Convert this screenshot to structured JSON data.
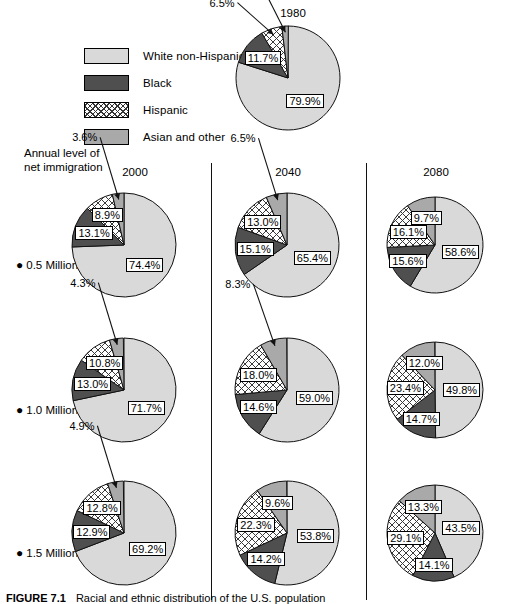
{
  "legend": {
    "items": [
      {
        "label": "White non-Hispanic",
        "key": "white",
        "swatch": "light-gray-solid",
        "color": "#d9d9d9"
      },
      {
        "label": "Black",
        "key": "black",
        "swatch": "dark-gray-solid",
        "color": "#4f4f4f"
      },
      {
        "label": "Hispanic",
        "key": "hispanic",
        "swatch": "crosshatch",
        "color": "#ffffff"
      },
      {
        "label": "Asian and other",
        "key": "asian",
        "swatch": "medium-gray-solid",
        "color": "#a9a9a9"
      }
    ]
  },
  "annual_caption": "Annual level of\nnet immigration",
  "row_labels": [
    {
      "bullet": "●",
      "text": "0.5 Million"
    },
    {
      "bullet": "●",
      "text": "1.0 Million"
    },
    {
      "bullet": "●",
      "text": "1.5 Million"
    }
  ],
  "bottom_caption": {
    "figure": "FIGURE 7.1",
    "text": "Racial and ethnic distribution of the U.S. population"
  },
  "chart_data": {
    "type": "pie",
    "categories": [
      "White non-Hispanic",
      "Black",
      "Hispanic",
      "Asian and other"
    ],
    "colors": [
      "#d9d9d9",
      "#4f4f4f",
      "#ffffff",
      "#a9a9a9"
    ],
    "units": "percent",
    "charts": [
      {
        "id": "pie-1980",
        "year": "1980",
        "immigration": null,
        "labels": [
          "79.9%",
          "11.7%",
          "6.5%",
          "2.0%"
        ],
        "values": [
          79.9,
          11.7,
          6.5,
          2.0
        ]
      },
      {
        "id": "pie-2000-05",
        "year": "2000",
        "immigration": "0.5 Million",
        "labels": [
          "74.4%",
          "13.1%",
          "8.9%",
          "3.6%"
        ],
        "values": [
          74.4,
          13.1,
          8.9,
          3.6
        ]
      },
      {
        "id": "pie-2040-05",
        "year": "2040",
        "immigration": "0.5 Million",
        "labels": [
          "65.4%",
          "15.1%",
          "13.0%",
          "6.5%"
        ],
        "values": [
          65.4,
          15.1,
          13.0,
          6.5
        ]
      },
      {
        "id": "pie-2080-05",
        "year": "2080",
        "immigration": "0.5 Million",
        "labels": [
          "58.6%",
          "15.6%",
          "16.1%",
          "9.7%"
        ],
        "values": [
          58.6,
          15.6,
          16.1,
          9.7
        ]
      },
      {
        "id": "pie-2000-10",
        "year": "2000",
        "immigration": "1.0 Million",
        "labels": [
          "71.7%",
          "13.0%",
          "10.8%",
          "4.3%"
        ],
        "values": [
          71.7,
          13.0,
          10.8,
          4.3
        ]
      },
      {
        "id": "pie-2040-10",
        "year": "2040",
        "immigration": "1.0 Million",
        "labels": [
          "59.0%",
          "14.6%",
          "18.0%",
          "8.3%"
        ],
        "values": [
          59.0,
          14.6,
          18.0,
          8.3
        ]
      },
      {
        "id": "pie-2080-10",
        "year": "2080",
        "immigration": "1.0 Million",
        "labels": [
          "49.8%",
          "14.7%",
          "23.4%",
          "12.0%"
        ],
        "values": [
          49.8,
          14.7,
          23.4,
          12.0
        ]
      },
      {
        "id": "pie-2000-15",
        "year": "2000",
        "immigration": "1.5 Million",
        "labels": [
          "69.2%",
          "12.9%",
          "12.8%",
          "4.9%"
        ],
        "values": [
          69.2,
          12.9,
          12.8,
          4.9
        ]
      },
      {
        "id": "pie-2040-15",
        "year": "2040",
        "immigration": "1.5 Million",
        "labels": [
          "53.8%",
          "14.2%",
          "22.3%",
          "9.6%"
        ],
        "values": [
          53.8,
          14.2,
          22.3,
          9.6
        ]
      },
      {
        "id": "pie-2080-15",
        "year": "2080",
        "immigration": "1.5 Million",
        "labels": [
          "43.5%",
          "14.1%",
          "29.1%",
          "13.3%"
        ],
        "values": [
          43.5,
          14.1,
          29.1,
          13.3
        ]
      }
    ]
  },
  "column_headers": [
    "1980",
    "2000",
    "2040",
    "2080"
  ],
  "layout": {
    "pies": [
      {
        "id": "pie-1980",
        "cx": 288,
        "cy": 78,
        "r": 52,
        "title_x": 288,
        "title_y": 8,
        "title_anchor": "1980"
      },
      {
        "id": "pie-2000-05",
        "cx": 124,
        "cy": 245,
        "r": 52,
        "title_x": 130,
        "title_y": 167
      },
      {
        "id": "pie-2040-05",
        "cx": 287,
        "cy": 245,
        "r": 52,
        "title_x": 287,
        "title_y": 167
      },
      {
        "id": "pie-2080-05",
        "cx": 435,
        "cy": 245,
        "r": 48,
        "title_x": 435,
        "title_y": 167
      },
      {
        "id": "pie-2000-10",
        "cx": 124,
        "cy": 390,
        "r": 52,
        "title_x": 0,
        "title_y": 0
      },
      {
        "id": "pie-2040-10",
        "cx": 287,
        "cy": 390,
        "r": 52,
        "title_x": 0,
        "title_y": 0
      },
      {
        "id": "pie-2080-10",
        "cx": 435,
        "cy": 390,
        "r": 48,
        "title_x": 0,
        "title_y": 0
      },
      {
        "id": "pie-2000-15",
        "cx": 124,
        "cy": 533,
        "r": 52,
        "title_x": 0,
        "title_y": 0
      },
      {
        "id": "pie-2040-15",
        "cx": 287,
        "cy": 533,
        "r": 52,
        "title_x": 0,
        "title_y": 0
      },
      {
        "id": "pie-2080-15",
        "cx": 435,
        "cy": 533,
        "r": 48,
        "title_x": 0,
        "title_y": 0
      }
    ]
  }
}
